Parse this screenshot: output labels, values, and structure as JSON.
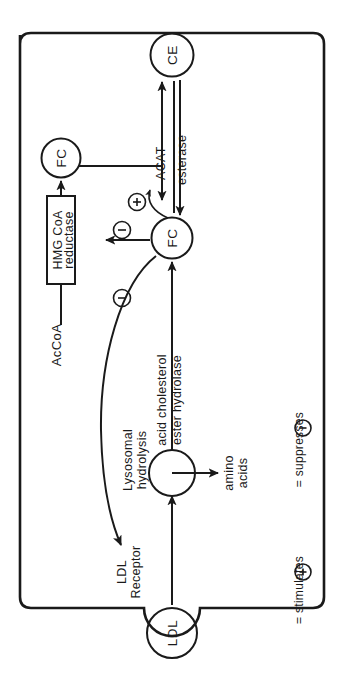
{
  "figure": {
    "type": "biochemical-pathway-diagram",
    "orientation": "rotated-90-ccw",
    "cell_boundary_label": "cell membrane"
  },
  "nodes": {
    "ce": "CE",
    "fc_cytosolic": "FC",
    "fc_pool": "FC",
    "ldl": "LDL",
    "lysosome": ""
  },
  "enzymes": {
    "acat": "ACAT",
    "esterase": "esterase",
    "hmg_line1": "HMG CoA",
    "hmg_line2": "reductase",
    "acid_chol_line1": "acid cholesterol",
    "acid_chol_line2": "ester hydrolase"
  },
  "labels": {
    "accoa": "AcCoA",
    "lysosomal_line1": "Lysosomal",
    "lysosomal_line2": "hydrolysis",
    "ldl_receptor_line1": "LDL",
    "ldl_receptor_line2": "Receptor",
    "amino_line1": "amino",
    "amino_line2": "acids"
  },
  "regulators": {
    "plus_glyph": "+",
    "minus_glyph": "-",
    "stimulates_acat": "+",
    "suppresses_hmg": "-",
    "suppresses_receptor": "-"
  },
  "legend": {
    "stimulates_symbol": "+",
    "stimulates_text": "= stimulates",
    "suppresses_symbol": "-",
    "suppresses_text": "= suppresses"
  },
  "colors": {
    "ink": "#1a1a1a",
    "background": "#ffffff"
  }
}
